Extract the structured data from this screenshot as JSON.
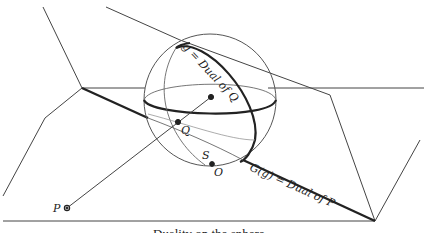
{
  "diagram": {
    "labels": {
      "g": "g = Dual of Q",
      "G": "G(g) = Dual of P",
      "P": "P",
      "Q": "Q",
      "S": "S",
      "O": "O"
    },
    "caption": "Duality on the sphere",
    "colors": {
      "stroke": "#333333",
      "thin": "#555555",
      "background": "#ffffff"
    }
  }
}
